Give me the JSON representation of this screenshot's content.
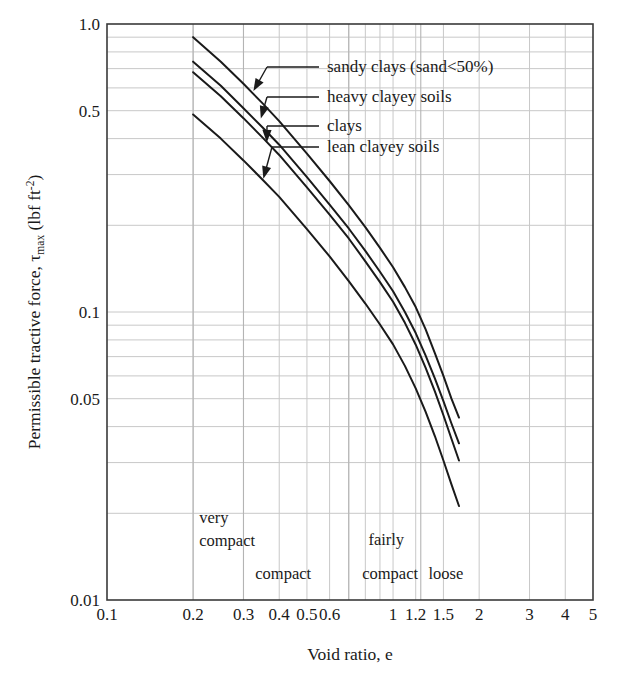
{
  "chart_data": {
    "type": "line",
    "title": "",
    "xlabel": "Void ratio, e",
    "ylabel": "Permissible tractive force, τmax (lbf ft-2)",
    "ylabel_main": "Permissible tractive force, ",
    "ylabel_tau": "τ",
    "ylabel_tau_sub": "max",
    "ylabel_unit_open": " (lbf ft",
    "ylabel_unit_sup": "-2",
    "ylabel_unit_close": ")",
    "xscale": "log",
    "yscale": "log",
    "xlim": [
      0.1,
      5
    ],
    "ylim": [
      0.01,
      1.0
    ],
    "grid": true,
    "grid_minor": true,
    "legend_position": "inside-upper-right-with-leader-lines",
    "x_ticks": [
      "0.1",
      "0.2",
      "0.3",
      "0.4",
      "0.5",
      "0.6",
      "1",
      "1.2",
      "1.5",
      "2",
      "3",
      "4",
      "5"
    ],
    "x_tick_values": [
      0.1,
      0.2,
      0.3,
      0.4,
      0.5,
      0.6,
      1,
      1.2,
      1.5,
      2,
      3,
      4,
      5
    ],
    "y_ticks": [
      "0.01",
      "0.05",
      "0.1",
      "0.5",
      "1.0"
    ],
    "y_tick_values": [
      0.01,
      0.05,
      0.1,
      0.5,
      1.0
    ],
    "series": [
      {
        "name": "sandy clays (sand<50%)",
        "label": "sandy clays (sand<50%)",
        "x": [
          0.2,
          0.25,
          0.3,
          0.35,
          0.4,
          0.5,
          0.6,
          0.7,
          0.8,
          0.9,
          1.0,
          1.1,
          1.2,
          1.3,
          1.4,
          1.5,
          1.6,
          1.7
        ],
        "y": [
          0.9,
          0.74,
          0.62,
          0.53,
          0.46,
          0.355,
          0.285,
          0.235,
          0.197,
          0.167,
          0.143,
          0.122,
          0.104,
          0.087,
          0.072,
          0.06,
          0.05,
          0.043
        ]
      },
      {
        "name": "heavy clayey soils",
        "label": "heavy clayey soils",
        "x": [
          0.2,
          0.25,
          0.3,
          0.35,
          0.4,
          0.5,
          0.6,
          0.7,
          0.8,
          0.9,
          1.0,
          1.1,
          1.2,
          1.3,
          1.4,
          1.5,
          1.6,
          1.7
        ],
        "y": [
          0.74,
          0.61,
          0.51,
          0.437,
          0.381,
          0.294,
          0.236,
          0.195,
          0.163,
          0.138,
          0.118,
          0.1,
          0.0845,
          0.0706,
          0.0588,
          0.049,
          0.041,
          0.035
        ]
      },
      {
        "name": "clays",
        "label": "clays",
        "x": [
          0.2,
          0.25,
          0.3,
          0.35,
          0.4,
          0.5,
          0.6,
          0.7,
          0.8,
          0.9,
          1.0,
          1.1,
          1.2,
          1.3,
          1.4,
          1.5,
          1.6,
          1.7
        ],
        "y": [
          0.68,
          0.561,
          0.471,
          0.403,
          0.351,
          0.271,
          0.218,
          0.18,
          0.15,
          0.127,
          0.1085,
          0.0917,
          0.077,
          0.064,
          0.053,
          0.0438,
          0.0363,
          0.0305
        ]
      },
      {
        "name": "lean clayey soils",
        "label": "lean clayey soils",
        "x": [
          0.2,
          0.25,
          0.3,
          0.35,
          0.4,
          0.5,
          0.6,
          0.7,
          0.8,
          0.9,
          1.0,
          1.1,
          1.2,
          1.3,
          1.4,
          1.5,
          1.6,
          1.7
        ],
        "y": [
          0.485,
          0.4,
          0.336,
          0.288,
          0.251,
          0.194,
          0.156,
          0.128,
          0.107,
          0.0905,
          0.0772,
          0.065,
          0.0543,
          0.045,
          0.0371,
          0.0305,
          0.0252,
          0.0212
        ]
      }
    ],
    "annotations": [
      {
        "name": "very-compact",
        "lines": [
          "very",
          "compact"
        ],
        "x": 0.21,
        "y": 0.0185
      },
      {
        "name": "compact",
        "lines": [
          "compact"
        ],
        "x": 0.33,
        "y": 0.0118
      },
      {
        "name": "fairly-compact-upper",
        "lines": [
          "fairly"
        ],
        "x": 0.82,
        "y": 0.0155
      },
      {
        "name": "fairly-compact-lower",
        "lines": [
          "compact"
        ],
        "x": 0.78,
        "y": 0.0118
      },
      {
        "name": "loose",
        "lines": [
          "loose"
        ],
        "x": 1.33,
        "y": 0.0118
      }
    ],
    "zone_dividers": [
      0.2,
      0.3,
      0.7,
      1.25
    ],
    "colors": {
      "curve": "#1a1a1a",
      "grid": "#c8c8c8",
      "axis": "#3a3a3a",
      "text": "#1a1a1a",
      "background": "#ffffff"
    }
  },
  "labels": {
    "sandy_clays": "sandy clays (sand<50%)",
    "heavy_clayey": "heavy clayey soils",
    "clays": "clays",
    "lean_clayey": "lean clayey soils"
  },
  "zones": {
    "very": "very",
    "compact1": "compact",
    "compact2": "compact",
    "fairly": "fairly",
    "compact3": "compact",
    "loose": "loose"
  },
  "axes": {
    "x_title": "Void ratio, e",
    "y_title_main": "Permissible tractive force, ",
    "y_tau": "τ",
    "y_tau_sub": "max",
    "y_unit_open": " (lbf ft",
    "y_unit_sup": "-2",
    "y_unit_close": ")",
    "x_ticks": [
      "0.1",
      "0.2",
      "0.3",
      "0.4",
      "0.5",
      "0.6",
      "1",
      "1.2",
      "1.5",
      "2",
      "3",
      "4",
      "5"
    ],
    "y_ticks": [
      "1.0",
      "0.5",
      "0.1",
      "0.05",
      "0.01"
    ]
  }
}
